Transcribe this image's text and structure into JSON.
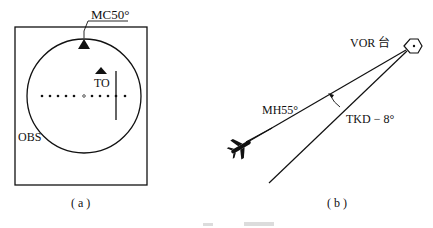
{
  "panel_a": {
    "course_label": "MC50°",
    "to_flag_label": "TO",
    "obs_label": "OBS",
    "caption": "( a )"
  },
  "panel_b": {
    "station_label": "VOR 台",
    "heading_label": "MH55°",
    "track_deviation_label": "TKD − 8°",
    "caption": "( b )"
  },
  "colors": {
    "line": "#111111",
    "background": "#ffffff",
    "faint_caption": "#d8d8d8"
  }
}
